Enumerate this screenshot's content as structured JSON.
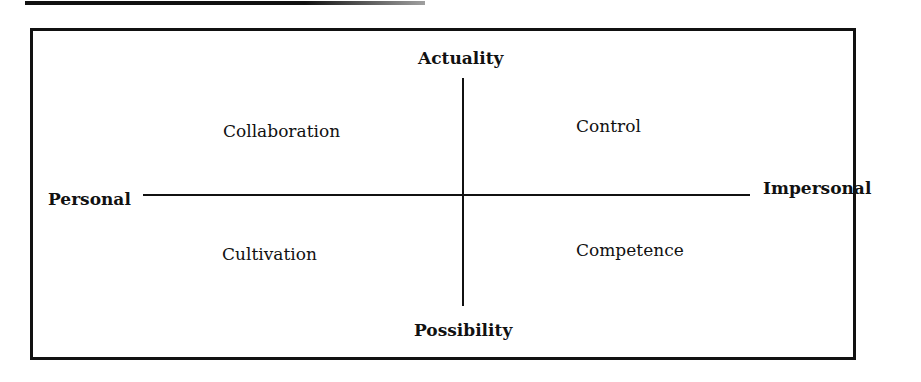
{
  "diagram": {
    "type": "two-axis quadrant diagram",
    "vertical_axis": {
      "top": "Actuality",
      "bottom": "Possibility"
    },
    "horizontal_axis": {
      "left": "Personal",
      "right": "Impersonal"
    },
    "quadrants": {
      "top_left": "Collaboration",
      "top_right": "Control",
      "bottom_left": "Cultivation",
      "bottom_right": "Competence"
    }
  },
  "colors": {
    "ink": "#111111",
    "background": "#ffffff"
  }
}
